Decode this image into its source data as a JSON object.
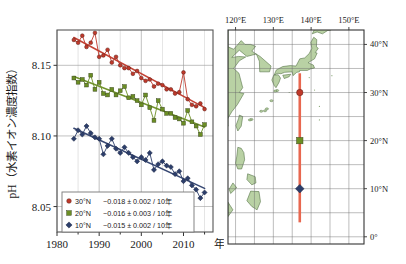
{
  "figure": {
    "left_panel_name": "ph-timeseries-chart",
    "right_panel_name": "station-location-map"
  },
  "chart_data": {
    "type": "line",
    "title": "",
    "xlabel": "年",
    "ylabel": "pH（水素イオン濃度指数）",
    "xlim": [
      1980,
      2017
    ],
    "ylim": [
      8.032,
      8.175
    ],
    "grid": true,
    "yticks": [
      "8.05",
      "8.10",
      "8.15"
    ],
    "ytick_values": [
      8.05,
      8.1,
      8.15
    ],
    "xticks": [
      "1980",
      "1990",
      "2000",
      "2010"
    ],
    "xtick_values": [
      1980,
      1990,
      2000,
      2010
    ],
    "minor_tick_step": 5,
    "legend_position": "lower-left",
    "series": [
      {
        "name": "30°N",
        "label": "30°N",
        "trend_label": "−0.018 ± 0.002 / 10年",
        "color": "#c0392b",
        "marker": "circle",
        "x": [
          1984,
          1985,
          1986,
          1987,
          1988,
          1989,
          1990,
          1991,
          1992,
          1993,
          1994,
          1995,
          1996,
          1997,
          1998,
          1999,
          2000,
          2001,
          2002,
          2003,
          2004,
          2005,
          2006,
          2007,
          2008,
          2009,
          2010,
          2011,
          2012,
          2013,
          2014,
          2015
        ],
        "values": [
          8.168,
          8.166,
          8.171,
          8.163,
          8.166,
          8.173,
          8.156,
          8.157,
          8.161,
          8.152,
          8.156,
          8.15,
          8.148,
          8.148,
          8.144,
          8.146,
          8.141,
          8.139,
          8.14,
          8.135,
          8.137,
          8.136,
          8.133,
          8.133,
          8.13,
          8.131,
          8.145,
          8.126,
          8.122,
          8.121,
          8.123,
          8.119
        ],
        "trend_start": [
          1984,
          8.1695
        ],
        "trend_end": [
          2015,
          8.1135
        ]
      },
      {
        "name": "20°N",
        "label": "20°N",
        "trend_label": "−0.016 ± 0.003 / 10年",
        "color": "#6b8e23",
        "marker": "square",
        "x": [
          1984,
          1985,
          1986,
          1987,
          1988,
          1989,
          1990,
          1991,
          1992,
          1993,
          1994,
          1995,
          1996,
          1997,
          1998,
          1999,
          2000,
          2001,
          2002,
          2003,
          2004,
          2005,
          2006,
          2007,
          2008,
          2009,
          2010,
          2011,
          2012,
          2013,
          2014,
          2015
        ],
        "values": [
          8.141,
          8.138,
          8.14,
          8.136,
          8.143,
          8.133,
          8.138,
          8.13,
          8.129,
          8.133,
          8.129,
          8.132,
          8.135,
          8.127,
          8.128,
          8.125,
          8.122,
          8.129,
          8.12,
          8.111,
          8.125,
          8.119,
          8.116,
          8.116,
          8.113,
          8.112,
          8.109,
          8.118,
          8.11,
          8.107,
          8.101,
          8.108
        ]
      },
      {
        "name": "10°N",
        "label": "10°N",
        "trend_label": "−0.015 ± 0.002 / 10年",
        "color": "#2c3e6b",
        "marker": "diamond",
        "x": [
          1984,
          1985,
          1986,
          1987,
          1988,
          1989,
          1990,
          1991,
          1992,
          1993,
          1994,
          1995,
          1996,
          1997,
          1998,
          1999,
          2000,
          2001,
          2002,
          2003,
          2004,
          2005,
          2006,
          2007,
          2008,
          2009,
          2010,
          2011,
          2012,
          2013,
          2014,
          2015
        ],
        "values": [
          8.098,
          8.104,
          8.101,
          8.107,
          8.102,
          8.099,
          8.098,
          8.087,
          8.093,
          8.098,
          8.091,
          8.088,
          8.092,
          8.088,
          8.085,
          8.082,
          8.085,
          8.083,
          8.088,
          8.076,
          8.08,
          8.082,
          8.079,
          8.078,
          8.073,
          8.075,
          8.068,
          8.07,
          8.065,
          8.062,
          8.056,
          8.06
        ]
      }
    ]
  },
  "legend": {
    "rows": [
      {
        "marker": "circle",
        "color": "#c0392b",
        "lat": "30°N",
        "trend": "−0.018 ± 0.002 / 10年"
      },
      {
        "marker": "square",
        "color": "#6b8e23",
        "lat": "20°N",
        "trend": "−0.016 ± 0.003 / 10年"
      },
      {
        "marker": "diamond",
        "color": "#2c3e6b",
        "lat": "10°N",
        "trend": "−0.015 ± 0.002 / 10年"
      }
    ]
  },
  "map": {
    "lon_range": [
      118,
      154
    ],
    "lat_range": [
      -1.5,
      43
    ],
    "lon_ticks": [
      "120°E",
      "130°E",
      "140°E",
      "150°E"
    ],
    "lon_tick_values": [
      120,
      130,
      140,
      150
    ],
    "lat_ticks": [
      "40°N",
      "30°N",
      "20°N",
      "10°N",
      "0°"
    ],
    "lat_tick_values": [
      40,
      30,
      20,
      10,
      0
    ],
    "grid_step": 5,
    "land_color": "#b9d1a4",
    "land_outline": "#4b6b3c",
    "ocean_color": "#ffffff",
    "observation_line": {
      "name": "137E-repeat-observation-line",
      "longitude": 137,
      "lat_from": 3,
      "lat_to": 34,
      "color": "#e8674f"
    },
    "stations": [
      {
        "name": "station-30n",
        "lat": 30,
        "lon": 137,
        "marker": "circle",
        "color": "#c0392b"
      },
      {
        "name": "station-20n",
        "lat": 20,
        "lon": 137,
        "marker": "square",
        "color": "#6b8e23"
      },
      {
        "name": "station-10n",
        "lat": 10,
        "lon": 137,
        "marker": "diamond",
        "color": "#2c3e6b"
      }
    ]
  }
}
